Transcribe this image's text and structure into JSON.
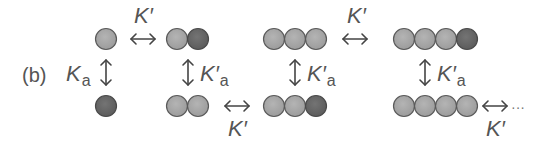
{
  "panel_label": "(b)",
  "colors": {
    "light_monomer": "#a9a9a9",
    "dark_monomer": "#6a6a6a",
    "stroke": "#5a5a5a",
    "arrow": "#444444",
    "text": "#555555"
  },
  "labels": {
    "k_prime": "K′",
    "k_a_main": "K",
    "k_a_sub": "a",
    "k_prime_a_main": "K′",
    "k_prime_a_sub": "a",
    "ellipsis": "···"
  },
  "top_row": [
    {
      "name": "monomer",
      "units": [
        "light"
      ]
    },
    {
      "name": "dimer",
      "units": [
        "light",
        "dark"
      ]
    },
    {
      "name": "trimer",
      "units": [
        "light",
        "light",
        "light"
      ]
    },
    {
      "name": "tetramer",
      "units": [
        "light",
        "light",
        "light",
        "dark"
      ]
    }
  ],
  "bottom_row": [
    {
      "name": "monomer-activated",
      "units": [
        "dark"
      ]
    },
    {
      "name": "dimer-activated",
      "units": [
        "light",
        "light"
      ]
    },
    {
      "name": "trimer-activated",
      "units": [
        "light",
        "light",
        "dark"
      ]
    },
    {
      "name": "tetramer-activated",
      "units": [
        "light",
        "light",
        "light",
        "light"
      ]
    }
  ],
  "equilibria": [
    {
      "type": "horizontal",
      "label": "K′",
      "between": "monomer ↔ dimer"
    },
    {
      "type": "vertical",
      "label": "Ka",
      "between": "monomer ↕ monomer-activated"
    },
    {
      "type": "vertical",
      "label": "K′a",
      "between": "dimer ↕ dimer-activated"
    },
    {
      "type": "horizontal",
      "label": "K′",
      "between": "dimer-activated ↔ trimer-activated"
    },
    {
      "type": "vertical",
      "label": "K′a",
      "between": "trimer ↕ trimer-activated"
    },
    {
      "type": "horizontal",
      "label": "K′",
      "between": "trimer ↔ tetramer"
    },
    {
      "type": "vertical",
      "label": "K′a",
      "between": "tetramer ↕ tetramer-activated"
    },
    {
      "type": "horizontal",
      "label": "K′",
      "between": "tetramer-activated ↔ ..."
    }
  ]
}
